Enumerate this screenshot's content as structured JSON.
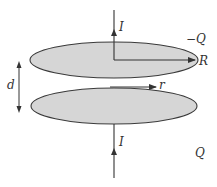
{
  "diagram": {
    "colors": {
      "plate_fill": "#d6d6d6",
      "plate_stroke": "#3a3a3a",
      "line": "#333333",
      "text": "#333333"
    },
    "labels": {
      "current_top": "I",
      "current_bottom": "I",
      "charge_top": "−Q",
      "charge_bottom": "Q",
      "radius": "R",
      "radial_distance": "r",
      "separation": "d"
    },
    "elements": [
      {
        "id": "top-plate",
        "shape": "ellipse",
        "charge": "−Q"
      },
      {
        "id": "bottom-plate",
        "shape": "ellipse",
        "charge": "Q"
      },
      {
        "id": "top-wire",
        "current": "I",
        "direction": "up"
      },
      {
        "id": "bottom-wire",
        "current": "I",
        "direction": "up"
      },
      {
        "id": "radius-arrow",
        "label": "R"
      },
      {
        "id": "r-arrow",
        "label": "r"
      },
      {
        "id": "separation-arrow",
        "label": "d",
        "double_headed": true
      }
    ]
  }
}
